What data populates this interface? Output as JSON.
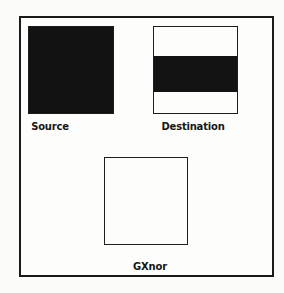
{
  "diagram": {
    "source": {
      "label": "Source",
      "fill": "black"
    },
    "destination": {
      "label": "Destination",
      "fill": "white with horizontal black band"
    },
    "result": {
      "label": "GXnor",
      "fill": "white"
    }
  },
  "colors": {
    "ink": "#121212",
    "paper": "#fbfbfa"
  }
}
